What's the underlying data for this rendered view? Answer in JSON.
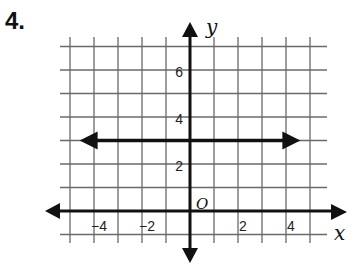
{
  "problem": {
    "number_label": "4."
  },
  "chart_data": {
    "type": "line",
    "title": "",
    "xlabel": "x",
    "ylabel": "y",
    "origin_label": "O",
    "xlim": [
      -5,
      5
    ],
    "ylim": [
      -1,
      7
    ],
    "grid": true,
    "x_ticks": [
      {
        "value": -4,
        "label": "−4"
      },
      {
        "value": -2,
        "label": "−2"
      },
      {
        "value": 2,
        "label": "2"
      },
      {
        "value": 4,
        "label": "4"
      }
    ],
    "y_ticks": [
      {
        "value": 2,
        "label": "2"
      },
      {
        "value": 4,
        "label": "4"
      },
      {
        "value": 6,
        "label": "6"
      }
    ],
    "series": [
      {
        "name": "y = 3",
        "equation": "y = 3",
        "x": [
          -4.6,
          4.6
        ],
        "y": [
          3,
          3
        ],
        "arrows": "both"
      }
    ],
    "legend": "none"
  }
}
